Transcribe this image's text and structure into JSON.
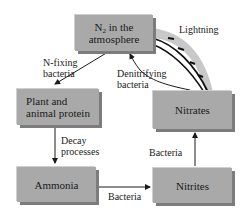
{
  "diagram": {
    "nodes": {
      "n2": {
        "main": "N",
        "sub": "2",
        "rest": " in the",
        "line2": "atmosphere"
      },
      "plant": {
        "line1": "Plant and",
        "line2": "animal protein"
      },
      "ammonia": {
        "label": "Ammonia"
      },
      "nitrites": {
        "label": "Nitrites"
      },
      "nitrates": {
        "label": "Nitrates"
      }
    },
    "edges": {
      "n2_to_plant": {
        "line1": "N-fixing",
        "line2": "bacteria"
      },
      "nitrates_to_n2": {
        "line1": "Denitrifying",
        "line2": "bacteria"
      },
      "n2_to_nitrates": {
        "label": "Lightning"
      },
      "plant_to_ammonia": {
        "line1": "Decay",
        "line2": "processes"
      },
      "ammonia_to_nitrites": {
        "label": "Bacteria"
      },
      "nitrites_to_nitrates": {
        "label": "Bacteria"
      }
    },
    "colors": {
      "box": "#a9a9a9",
      "shadow": "#7c7c7c",
      "arrow": "#1a1a1a",
      "lightning_band": "#c8c8c8"
    }
  }
}
